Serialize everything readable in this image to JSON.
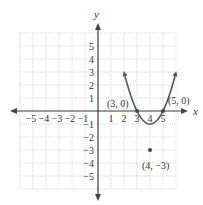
{
  "chart_data": {
    "type": "line",
    "title": "",
    "xlabel": "x",
    "ylabel": "y",
    "xlim": [
      -6,
      6
    ],
    "ylim": [
      -6,
      6
    ],
    "grid": true,
    "x_ticks": [
      -5,
      -4,
      -3,
      -2,
      -1,
      1,
      2,
      3,
      4,
      5
    ],
    "y_ticks": [
      -5,
      -4,
      -3,
      -2,
      -1,
      1,
      2,
      3,
      4,
      5
    ],
    "function": "y = (x - 3)(x - 5)",
    "series": [
      {
        "name": "parabola",
        "x": [
          2.1,
          2.5,
          3,
          3.5,
          4,
          4.5,
          5,
          5.5,
          5.9
        ],
        "y": [
          5.3,
          3.75,
          0,
          -2.25,
          -3,
          -2.25,
          0,
          3.75,
          5.3
        ]
      }
    ],
    "points": [
      {
        "x": 3,
        "y": 0,
        "label": "(3, 0)"
      },
      {
        "x": 5,
        "y": 0,
        "label": "(5, 0)"
      },
      {
        "x": 4,
        "y": -3,
        "label": "(4, −3)"
      }
    ]
  },
  "labels": {
    "x_axis": "x",
    "y_axis": "y",
    "x_tick_labels": [
      "−5",
      "−4",
      "−3",
      "−2",
      "−1",
      "1",
      "2",
      "3",
      "4",
      "5"
    ],
    "y_tick_labels": [
      "5",
      "4",
      "3",
      "2",
      "1",
      "−1",
      "−2",
      "−3",
      "−4",
      "−5"
    ],
    "point_3_0": "(3, 0)",
    "point_5_0": "(5, 0)",
    "vertex": "(4, −3)"
  }
}
